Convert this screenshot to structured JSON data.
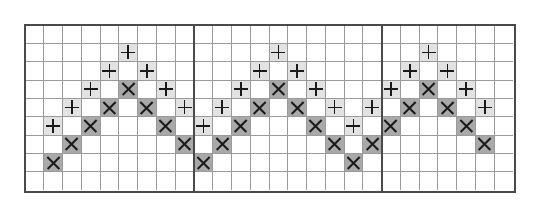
{
  "diagram": {
    "title": "",
    "grid": {
      "columns": 26,
      "rows": 9,
      "section_dividers_after_column": [
        9,
        19
      ],
      "sections": [
        {
          "name": "left",
          "columns": 9
        },
        {
          "name": "middle",
          "columns": 10
        },
        {
          "name": "right",
          "columns": 7
        }
      ]
    },
    "legend": {
      "plus": {
        "symbol": "+",
        "fill": "#e2e2e2"
      },
      "cross": {
        "symbol": "×",
        "fill": "#a9a9a9"
      }
    },
    "colors": {
      "grid_line": "#9a9a9a",
      "border": "#4a4a4a",
      "mark": "#1a1a1a",
      "background": "#ffffff"
    },
    "cells": [
      {
        "row": 1,
        "col": 5,
        "mark": "plus"
      },
      {
        "row": 2,
        "col": 4,
        "mark": "plus"
      },
      {
        "row": 2,
        "col": 6,
        "mark": "plus"
      },
      {
        "row": 3,
        "col": 3,
        "mark": "plus"
      },
      {
        "row": 3,
        "col": 5,
        "mark": "cross"
      },
      {
        "row": 3,
        "col": 7,
        "mark": "plus"
      },
      {
        "row": 4,
        "col": 2,
        "mark": "plus"
      },
      {
        "row": 4,
        "col": 4,
        "mark": "cross"
      },
      {
        "row": 4,
        "col": 6,
        "mark": "cross"
      },
      {
        "row": 4,
        "col": 8,
        "mark": "plus"
      },
      {
        "row": 5,
        "col": 1,
        "mark": "plus"
      },
      {
        "row": 5,
        "col": 3,
        "mark": "cross"
      },
      {
        "row": 5,
        "col": 7,
        "mark": "cross"
      },
      {
        "row": 6,
        "col": 2,
        "mark": "cross"
      },
      {
        "row": 6,
        "col": 8,
        "mark": "cross"
      },
      {
        "row": 7,
        "col": 1,
        "mark": "cross"
      },
      {
        "row": 1,
        "col": 13,
        "mark": "plus"
      },
      {
        "row": 2,
        "col": 12,
        "mark": "plus"
      },
      {
        "row": 2,
        "col": 14,
        "mark": "plus"
      },
      {
        "row": 3,
        "col": 11,
        "mark": "plus"
      },
      {
        "row": 3,
        "col": 13,
        "mark": "cross"
      },
      {
        "row": 3,
        "col": 15,
        "mark": "plus"
      },
      {
        "row": 4,
        "col": 10,
        "mark": "plus"
      },
      {
        "row": 4,
        "col": 12,
        "mark": "cross"
      },
      {
        "row": 4,
        "col": 14,
        "mark": "cross"
      },
      {
        "row": 4,
        "col": 16,
        "mark": "plus"
      },
      {
        "row": 4,
        "col": 18,
        "mark": "plus"
      },
      {
        "row": 5,
        "col": 9,
        "mark": "plus"
      },
      {
        "row": 5,
        "col": 11,
        "mark": "cross"
      },
      {
        "row": 5,
        "col": 15,
        "mark": "cross"
      },
      {
        "row": 5,
        "col": 17,
        "mark": "plus"
      },
      {
        "row": 6,
        "col": 10,
        "mark": "cross"
      },
      {
        "row": 6,
        "col": 16,
        "mark": "cross"
      },
      {
        "row": 6,
        "col": 18,
        "mark": "cross"
      },
      {
        "row": 7,
        "col": 9,
        "mark": "cross"
      },
      {
        "row": 7,
        "col": 17,
        "mark": "cross"
      },
      {
        "row": 1,
        "col": 21,
        "mark": "plus"
      },
      {
        "row": 2,
        "col": 20,
        "mark": "plus"
      },
      {
        "row": 2,
        "col": 22,
        "mark": "plus"
      },
      {
        "row": 3,
        "col": 19,
        "mark": "plus"
      },
      {
        "row": 3,
        "col": 21,
        "mark": "cross"
      },
      {
        "row": 3,
        "col": 23,
        "mark": "plus"
      },
      {
        "row": 4,
        "col": 20,
        "mark": "cross"
      },
      {
        "row": 4,
        "col": 22,
        "mark": "cross"
      },
      {
        "row": 4,
        "col": 24,
        "mark": "plus"
      },
      {
        "row": 5,
        "col": 19,
        "mark": "cross"
      },
      {
        "row": 5,
        "col": 23,
        "mark": "cross"
      },
      {
        "row": 6,
        "col": 24,
        "mark": "cross"
      }
    ]
  }
}
